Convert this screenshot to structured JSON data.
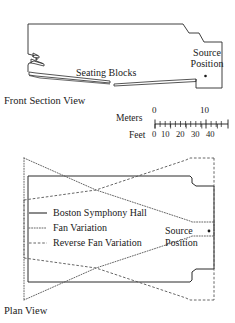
{
  "figure": {
    "top_clipped_text": "",
    "front_section": {
      "view_label": "Front Section View",
      "seating_label": "Seating Blocks",
      "source_label_line1": "Source",
      "source_label_line2": "Position",
      "source_marker": "source-position-dot"
    },
    "scale_bar": {
      "meters_label": "Meters",
      "feet_label": "Feet",
      "meters_ticks": [
        "0",
        "10"
      ],
      "meters_tick_values": [
        0,
        10
      ],
      "feet_ticks": [
        "0",
        "10",
        "20",
        "30",
        "40"
      ],
      "feet_tick_values": [
        0,
        10,
        20,
        30,
        40
      ]
    },
    "plan_view": {
      "view_label": "Plan View",
      "source_label_line1": "Source",
      "source_label_line2": "Position",
      "source_marker": "source-position-dot",
      "legend": {
        "items": [
          {
            "label": "Boston Symphony Hall",
            "style": "solid",
            "swatch": "solid-line-swatch"
          },
          {
            "label": "Fan Variation",
            "style": "dotted",
            "swatch": "dotted-line-swatch"
          },
          {
            "label": "Reverse Fan Variation",
            "style": "dashed",
            "swatch": "dashed-line-swatch"
          }
        ]
      }
    },
    "colors": {
      "ink": "#1a1a1a",
      "outline": "#2a2a2a",
      "dotted": "#555555",
      "background": "#ffffff"
    }
  }
}
